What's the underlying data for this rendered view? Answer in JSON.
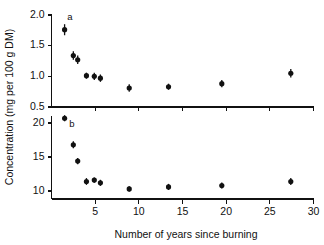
{
  "figure": {
    "y_axis_title": "Concentration  (mg per 100 g DM)",
    "x_axis_title": "Number of years since burning",
    "panel_a_label": "a",
    "panel_b_label": "b",
    "marker_color": "#111111",
    "axis_color": "#111111",
    "background_color": "#ffffff"
  },
  "chart_data": [
    {
      "type": "scatter",
      "panel": "a",
      "title": "a",
      "xlabel": "Number of years since burning",
      "ylabel": "Concentration  (mg per 100 g DM)",
      "xlim": [
        0,
        30
      ],
      "ylim": [
        0.5,
        2.0
      ],
      "xticks": [
        5,
        10,
        15,
        20,
        25,
        30
      ],
      "xtick_labels": [
        "5",
        "10",
        "15",
        "20",
        "25",
        "30"
      ],
      "yticks": [
        0.5,
        1.0,
        1.5,
        2.0
      ],
      "ytick_labels": [
        "0.5",
        "1.0",
        "1.5",
        "2.0"
      ],
      "grid": false,
      "legend": "none",
      "error_bars": "vertical",
      "x": [
        1.5,
        2.5,
        3.0,
        4.0,
        4.9,
        5.6,
        8.9,
        13.4,
        19.5,
        27.4
      ],
      "y": [
        1.76,
        1.34,
        1.27,
        1.01,
        1.0,
        0.97,
        0.81,
        0.83,
        0.88,
        1.05
      ],
      "yerr": [
        0.09,
        0.07,
        0.07,
        0.05,
        0.06,
        0.06,
        0.06,
        0.05,
        0.06,
        0.07
      ]
    },
    {
      "type": "scatter",
      "panel": "b",
      "title": "b",
      "xlabel": "Number of years since burning",
      "ylabel": "Concentration  (mg per 100 g DM)",
      "xlim": [
        0,
        30
      ],
      "ylim": [
        8.8,
        21.2
      ],
      "xticks": [
        5,
        10,
        15,
        20,
        25,
        30
      ],
      "xtick_labels": [
        "5",
        "10",
        "15",
        "20",
        "25",
        "30"
      ],
      "yticks": [
        10,
        15,
        20
      ],
      "ytick_labels": [
        "10",
        "15",
        "20"
      ],
      "grid": false,
      "legend": "none",
      "error_bars": "vertical",
      "x": [
        1.5,
        2.5,
        3.0,
        4.0,
        4.9,
        5.6,
        8.9,
        13.4,
        19.5,
        27.4
      ],
      "y": [
        20.7,
        16.8,
        14.4,
        11.4,
        11.6,
        11.2,
        10.3,
        10.6,
        10.8,
        11.4
      ],
      "yerr": [
        0.45,
        0.5,
        0.45,
        0.5,
        0.4,
        0.45,
        0.4,
        0.45,
        0.45,
        0.5
      ]
    }
  ]
}
